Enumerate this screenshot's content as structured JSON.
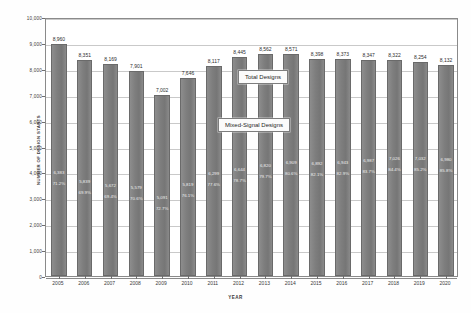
{
  "chart_data": {
    "type": "bar",
    "title": "",
    "xlabel": "YEAR",
    "ylabel": "NUMBER OF DESIGN STARTS",
    "ylim": [
      0,
      10000
    ],
    "ytick_labels": [
      "10,000",
      "9,000",
      "8,000",
      "7,000",
      "6,000",
      "5,000",
      "4,000",
      "3,000",
      "2,000",
      "1,000",
      "0"
    ],
    "ytick_values": [
      10000,
      9000,
      8000,
      7000,
      6000,
      5000,
      4000,
      3000,
      2000,
      1000,
      0
    ],
    "grid": true,
    "legend_position": "inline-callouts",
    "categories": [
      "2005",
      "2006",
      "2007",
      "2008",
      "2009",
      "2010",
      "2011",
      "2012",
      "2013",
      "2014",
      "2015",
      "2016",
      "2017",
      "2018",
      "2019",
      "2020"
    ],
    "series": [
      {
        "name": "Total Designs",
        "values": [
          8960,
          8351,
          8169,
          7901,
          7002,
          7646,
          8117,
          8445,
          8562,
          8571,
          8398,
          8373,
          8347,
          8322,
          8254,
          8132
        ],
        "value_labels": [
          "8,960",
          "8,351",
          "8,169",
          "7,901",
          "7,002",
          "7,646",
          "8,117",
          "8,445",
          "8,562",
          "8,571",
          "8,398",
          "8,373",
          "8,347",
          "8,322",
          "8,254",
          "8,132"
        ]
      },
      {
        "name": "Mixed-Signal Designs",
        "values": [
          6383,
          5839,
          5672,
          5579,
          5091,
          5819,
          6299,
          6644,
          6820,
          6909,
          6892,
          6943,
          6987,
          7026,
          7032,
          6980
        ],
        "value_labels": [
          "6,383",
          "5,839",
          "5,672",
          "5,579",
          "5,091",
          "5,819",
          "6,299",
          "6,644",
          "6,820",
          "6,909",
          "6,892",
          "6,943",
          "6,987",
          "7,026",
          "7,032",
          "6,980"
        ],
        "percent_labels": [
          "71.2%",
          "69.9%",
          "69.4%",
          "70.6%",
          "72.7%",
          "76.1%",
          "77.6%",
          "78.7%",
          "79.7%",
          "80.6%",
          "82.1%",
          "82.9%",
          "83.7%",
          "84.4%",
          "85.2%",
          "85.8%"
        ],
        "percent_values": [
          71.2,
          69.9,
          69.4,
          70.6,
          72.7,
          76.1,
          77.6,
          78.7,
          79.7,
          80.6,
          82.1,
          82.9,
          83.7,
          84.4,
          85.2,
          85.8
        ]
      }
    ],
    "annotations": [
      {
        "id": "total-designs",
        "text": "Total Designs"
      },
      {
        "id": "mixed-signal-designs",
        "text": "Mixed-Signal Designs"
      }
    ]
  },
  "colors": {
    "bar_fill": "#7e7e7e",
    "bar_border": "#6a6a6a",
    "grid": "#c9c9c9",
    "axis": "#8a8a8a",
    "background": "#ffffff",
    "inner_label_text": "#efefef",
    "callout_background": "#fbfbfb"
  }
}
